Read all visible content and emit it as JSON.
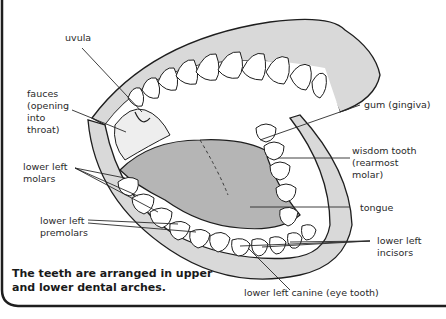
{
  "figure": {
    "caption": "The teeth are arranged in upper\nand lower dental arches.",
    "colors": {
      "gum": "#d9d9d9",
      "tongue": "#b5b5b5",
      "tooth": "#ffffff",
      "outline": "#1e1e1e",
      "background": "#ffffff"
    }
  },
  "labels": {
    "uvula": "uvula",
    "fauces": "fauces\n(opening\ninto\nthroat)",
    "gum": "gum (gingiva)",
    "wisdom_tooth": "wisdom tooth\n(rearmost\nmolar)",
    "lower_left_molars": "lower left\nmolars",
    "tongue": "tongue",
    "lower_left_premolars": "lower left\npremolars",
    "lower_left_incisors": "lower left\nincisors",
    "lower_left_canine": "lower left canine (eye tooth)"
  }
}
